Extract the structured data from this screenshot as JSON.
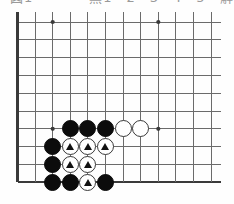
{
  "caption": {
    "text": "図1　　　　黒1　2　3　4　5　解説図"
  },
  "board": {
    "type": "go-board-corner",
    "corner": "bottom-left",
    "cols": 12,
    "rows": 10,
    "origin_x": 17.5,
    "origin_y": 22.0,
    "step_x": 17.6,
    "step_y": 17.8,
    "stone_radius": 8.6,
    "line_color": "#6b6b6b",
    "edge_color": "#3a3a3a",
    "background_color": "#fefefe",
    "black_color": "#0c0c0c",
    "white_color": "#ffffff",
    "marker_color": "#111111",
    "star_points": [
      {
        "col": 3,
        "row": 1
      },
      {
        "col": 9,
        "row": 1
      },
      {
        "col": 3,
        "row": 7
      },
      {
        "col": 9,
        "row": 7
      }
    ],
    "stones": [
      {
        "col": 4,
        "row": 7,
        "color": "black",
        "marker": "none"
      },
      {
        "col": 5,
        "row": 7,
        "color": "black",
        "marker": "none"
      },
      {
        "col": 6,
        "row": 7,
        "color": "black",
        "marker": "none"
      },
      {
        "col": 7,
        "row": 7,
        "color": "white",
        "marker": "none"
      },
      {
        "col": 8,
        "row": 7,
        "color": "white",
        "marker": "none"
      },
      {
        "col": 3,
        "row": 8,
        "color": "black",
        "marker": "none"
      },
      {
        "col": 4,
        "row": 8,
        "color": "white",
        "marker": "triangle"
      },
      {
        "col": 5,
        "row": 8,
        "color": "white",
        "marker": "triangle"
      },
      {
        "col": 6,
        "row": 8,
        "color": "white",
        "marker": "triangle"
      },
      {
        "col": 3,
        "row": 9,
        "color": "black",
        "marker": "none"
      },
      {
        "col": 4,
        "row": 9,
        "color": "white",
        "marker": "triangle"
      },
      {
        "col": 5,
        "row": 9,
        "color": "white",
        "marker": "triangle"
      },
      {
        "col": 3,
        "row": 10,
        "color": "black",
        "marker": "none"
      },
      {
        "col": 4,
        "row": 10,
        "color": "black",
        "marker": "none"
      },
      {
        "col": 5,
        "row": 10,
        "color": "white",
        "marker": "triangle"
      },
      {
        "col": 6,
        "row": 10,
        "color": "black",
        "marker": "none"
      }
    ]
  }
}
